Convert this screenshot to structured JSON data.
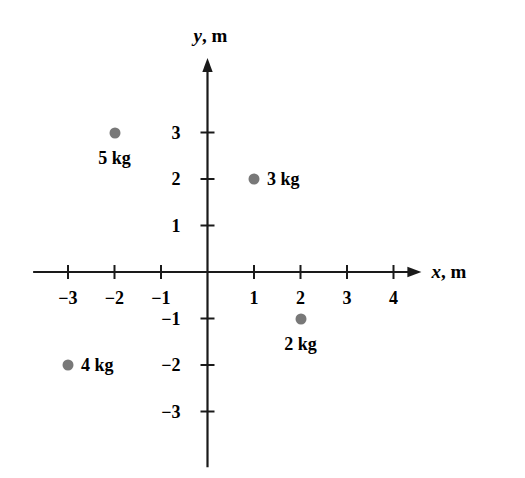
{
  "chart_data": {
    "type": "scatter",
    "title": "",
    "xlabel": "x, m",
    "ylabel": "y, m",
    "xlim": [
      -3.75,
      4.6
    ],
    "ylim": [
      -4.2,
      4.6
    ],
    "grid": false,
    "legend": "none",
    "marker_color": "#787878",
    "axis_color": "#1a1a1a",
    "x_ticks": [
      {
        "value": -3,
        "label": "−3"
      },
      {
        "value": -2,
        "label": "−2"
      },
      {
        "value": -1,
        "label": "−1"
      },
      {
        "value": 1,
        "label": "1"
      },
      {
        "value": 2,
        "label": "2"
      },
      {
        "value": 3,
        "label": "3"
      },
      {
        "value": 4,
        "label": "4"
      }
    ],
    "y_ticks": [
      {
        "value": 3,
        "label": "3"
      },
      {
        "value": 2,
        "label": "2"
      },
      {
        "value": 1,
        "label": "1"
      },
      {
        "value": -1,
        "label": "−1"
      },
      {
        "value": -2,
        "label": "−2"
      },
      {
        "value": -3,
        "label": "−3"
      }
    ],
    "points": [
      {
        "label": "5 kg",
        "mass": 5,
        "unit": "kg",
        "x": -2,
        "y": 3,
        "label_position": "below"
      },
      {
        "label": "3 kg",
        "mass": 3,
        "unit": "kg",
        "x": 1,
        "y": 2,
        "label_position": "right"
      },
      {
        "label": "2 kg",
        "mass": 2,
        "unit": "kg",
        "x": 2,
        "y": -1,
        "label_position": "below"
      },
      {
        "label": "4 kg",
        "mass": 4,
        "unit": "kg",
        "x": -3,
        "y": -2,
        "label_position": "right"
      }
    ]
  },
  "axes": {
    "x_axis_var": "x",
    "x_axis_unit": "m",
    "x_axis_separator": ",",
    "y_axis_var": "y",
    "y_axis_unit": "m",
    "y_axis_separator": ","
  }
}
